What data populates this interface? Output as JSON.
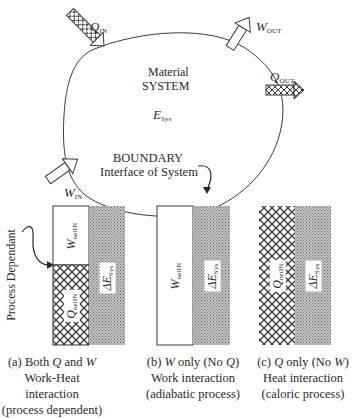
{
  "system": {
    "title_line1": "Material",
    "title_line2": "SYSTEM",
    "energy_symbol": "E",
    "energy_subscript": "Sys",
    "boundary_label": "BOUNDARY",
    "boundary_sublabel": "Interface of System"
  },
  "arrows": {
    "q_in": {
      "symbol": "Q",
      "subscript": "IN",
      "type": "heat"
    },
    "w_out": {
      "symbol": "W",
      "subscript": "OUT",
      "type": "work"
    },
    "q_out": {
      "symbol": "Q",
      "subscript": "OUT",
      "type": "heat"
    },
    "w_in": {
      "symbol": "W",
      "subscript": "IN",
      "type": "work"
    }
  },
  "process_dependant_label": "Process Dependant",
  "panels": [
    {
      "id": "a",
      "left_top": {
        "symbol": "W",
        "subscript": "netIN"
      },
      "left_bottom": {
        "symbol": "Q",
        "subscript": "netIN"
      },
      "right": {
        "symbol": "ΔE",
        "subscript": "Sys"
      },
      "caption_line1_pre": "(a) Both ",
      "caption_line1_q": "Q",
      "caption_line1_mid": " and ",
      "caption_line1_w": "W",
      "caption_line2": "Work-Heat interaction",
      "caption_line3": "(process dependent)"
    },
    {
      "id": "b",
      "left": {
        "symbol": "W",
        "subscript": "netIN"
      },
      "right": {
        "symbol": "ΔE",
        "subscript": "Sys"
      },
      "caption_line1_pre": "(b) ",
      "caption_line1_w": "W",
      "caption_line1_mid": " only (No ",
      "caption_line1_q": "Q",
      "caption_line1_post": ")",
      "caption_line2": "Work interaction",
      "caption_line3": "(adiabatic process)"
    },
    {
      "id": "c",
      "left": {
        "symbol": "Q",
        "subscript": "netIN"
      },
      "right": {
        "symbol": "ΔE",
        "subscript": "Sys"
      },
      "caption_line1_pre": "(c) ",
      "caption_line1_q": "Q",
      "caption_line1_mid": " only (No ",
      "caption_line1_w": "W",
      "caption_line1_post": ")",
      "caption_line2": "Heat interaction",
      "caption_line3": "(caloric process)"
    }
  ],
  "colors": {
    "ink": "#2a2a2a",
    "stipple": "#9a9a9a",
    "background": "#ffffff"
  }
}
